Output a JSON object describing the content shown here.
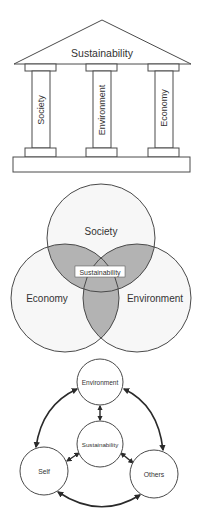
{
  "colors": {
    "stroke": "#4a4a4a",
    "text": "#333333",
    "overlap_fill": "#b3b3b3",
    "circle_fill": "#f7f7f7",
    "background": "#ffffff",
    "arrow": "#2a2a2a"
  },
  "temple": {
    "roof_label": "Sustainability",
    "pillars": [
      {
        "label": "Society"
      },
      {
        "label": "Environment"
      },
      {
        "label": "Economy"
      }
    ]
  },
  "venn": {
    "circles": [
      {
        "label": "Society"
      },
      {
        "label": "Economy"
      },
      {
        "label": "Environment"
      }
    ],
    "center_label": "Sustainability"
  },
  "network": {
    "nodes": [
      {
        "id": "environment",
        "label": "Environment"
      },
      {
        "id": "sustainability",
        "label": "Sustainability"
      },
      {
        "id": "self",
        "label": "Self"
      },
      {
        "id": "others",
        "label": "Others"
      }
    ],
    "edges": [
      {
        "from": "self",
        "to": "environment",
        "type": "bidirectional"
      },
      {
        "from": "environment",
        "to": "others",
        "type": "bidirectional"
      },
      {
        "from": "self",
        "to": "others",
        "type": "bidirectional"
      },
      {
        "from": "environment",
        "to": "sustainability",
        "type": "bidirectional"
      },
      {
        "from": "sustainability",
        "to": "self",
        "type": "bidirectional"
      },
      {
        "from": "sustainability",
        "to": "others",
        "type": "bidirectional"
      }
    ]
  }
}
